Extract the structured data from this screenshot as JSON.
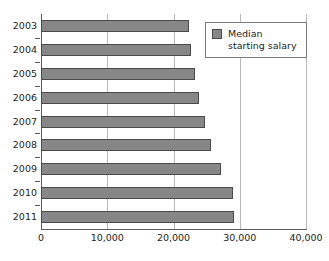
{
  "chart_data": {
    "type": "bar",
    "orientation": "horizontal",
    "title": "",
    "subtitle": "",
    "xlabel": "",
    "ylabel": "",
    "categories": [
      "2003",
      "2004",
      "2005",
      "2006",
      "2007",
      "2008",
      "2009",
      "2010",
      "2011"
    ],
    "series": [
      {
        "name": "Median starting salary",
        "values": [
          22300,
          22600,
          23200,
          23900,
          24700,
          25600,
          27100,
          29000,
          29100
        ],
        "color": "#878787"
      }
    ],
    "xlim": [
      0,
      40000
    ],
    "xticks": [
      0,
      10000,
      20000,
      30000,
      40000
    ],
    "xtick_labels": [
      "0",
      "10,000",
      "20,000",
      "30,000",
      "40,000"
    ],
    "grid": "vertical",
    "legend_position": "top-right"
  },
  "legend": {
    "label": "Median starting salary",
    "swatch_color": "#878787"
  },
  "axis": {
    "zero_line_color": "#5d5d5d",
    "gridline_color": "#b9b9b9"
  }
}
